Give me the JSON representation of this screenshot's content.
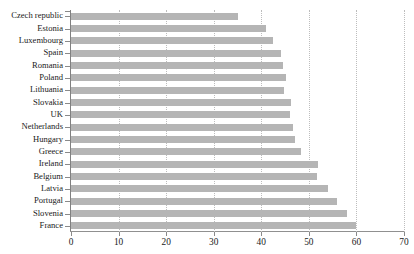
{
  "chart_data": {
    "type": "bar",
    "orientation": "horizontal",
    "title": "",
    "subtitle": "",
    "xlabel": "",
    "ylabel": "",
    "xlim": [
      0,
      70
    ],
    "xticks": [
      0,
      10,
      20,
      30,
      40,
      50,
      60,
      70
    ],
    "grid": "vertical-dotted",
    "legend": "none",
    "bar_color": "#b5b5b5",
    "categories": [
      "Czech republic",
      "Estonia",
      "Luxembourg",
      "Spain",
      "Romania",
      "Poland",
      "Lithuania",
      "Slovakia",
      "UK",
      "Netherlands",
      "Hungary",
      "Greece",
      "Ireland",
      "Belgium",
      "Latvia",
      "Portugal",
      "Slovenia",
      "France"
    ],
    "values": [
      35.0,
      41.0,
      42.5,
      44.1,
      44.6,
      45.2,
      44.8,
      46.2,
      46.0,
      46.7,
      47.0,
      48.4,
      52.0,
      51.8,
      54.0,
      56.0,
      58.0,
      60.0
    ]
  },
  "axis": {
    "x_tick_labels": [
      "0",
      "10",
      "20",
      "30",
      "40",
      "50",
      "60",
      "70"
    ]
  }
}
